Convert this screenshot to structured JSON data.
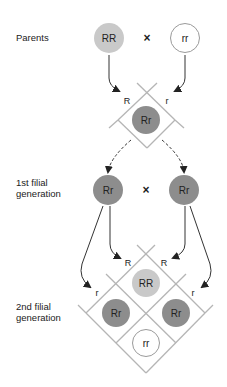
{
  "labels": {
    "parents": "Parents",
    "f1_line1": "1st filial",
    "f1_line2": "generation",
    "f2_line1": "2nd filial",
    "f2_line2": "generation"
  },
  "cross_symbol": "×",
  "colors": {
    "dominant_homozygous": "#c9c9c9",
    "heterozygous": "#8d8d8d",
    "recessive_homozygous": "#ffffff",
    "grid_line": "#b5b5b5",
    "arrow": "#333333",
    "text": "#222222"
  },
  "parents": {
    "left": "RR",
    "right": "rr"
  },
  "f1_square": {
    "allele_left": "R",
    "allele_right": "r",
    "offspring": "Rr"
  },
  "f1": {
    "left": "Rr",
    "right": "Rr"
  },
  "f2_square": {
    "allele_top_left": "R",
    "allele_top_right": "R",
    "allele_bottom_left": "r",
    "allele_bottom_right": "r",
    "top": "RR",
    "left": "Rr",
    "right": "Rr",
    "bottom": "rr"
  }
}
